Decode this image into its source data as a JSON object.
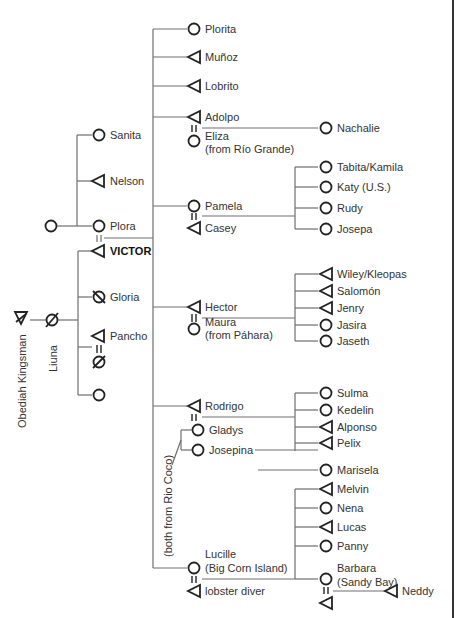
{
  "diagram": {
    "legend": {
      "circle": "female",
      "triangle": "male",
      "slashed": "deceased",
      "equals": "marriage"
    },
    "ancestors": {
      "obediah": "Obediah Kingsman",
      "liuna": "Liuna"
    },
    "generation1": [
      {
        "name": "Sanita",
        "sex": "female"
      },
      {
        "name": "Nelson",
        "sex": "male"
      },
      {
        "name": "Plora",
        "sex": "female"
      },
      {
        "name": "VICTOR",
        "sex": "male",
        "ego": true
      },
      {
        "name": "Gloria",
        "sex": "female",
        "deceased": true
      },
      {
        "name": "Pancho",
        "sex": "male"
      },
      {
        "name": "",
        "sex": "female"
      }
    ],
    "children": {
      "plorita": "Plorita",
      "munoz": "Muñoz",
      "lobrito": "Lobrito",
      "adolpo": "Adolpo",
      "eliza": "Eliza",
      "eliza_note": "(from Río Grande)",
      "nachalie": "Nachalie",
      "pamela": "Pamela",
      "casey": "Casey",
      "hector": "Hector",
      "maura": "Maura",
      "maura_note": "(from Páhara)",
      "rodrigo": "Rodrigo",
      "gladys": "Gladys",
      "josepina": "Josepina",
      "rio_coco_note": "(both from Rio Coco)",
      "lucille": "Lucille",
      "lucille_note": "(Big Corn Island)",
      "lobster_diver": "lobster diver"
    },
    "grandchildren": {
      "pamela_kids": [
        "Tabita/Kamila",
        "Katy (U.S.)",
        "Rudy",
        "Josepa"
      ],
      "hector_kids": [
        "Wiley/Kleopas",
        "Salomón",
        "Jenry",
        "Jasira",
        "Jaseth"
      ],
      "rodrigo_kids": [
        "Sulma",
        "Kedelin",
        "Alponso",
        "Pelix"
      ],
      "josepina_kids": [
        "Marisela"
      ],
      "lucille_kids": [
        "Melvin",
        "Nena",
        "Lucas",
        "Panny",
        "Barbara"
      ],
      "barbara_note": "(Sandy Bay)"
    },
    "great_grandchildren": {
      "barbara_kids": [
        "Neddy"
      ]
    }
  }
}
